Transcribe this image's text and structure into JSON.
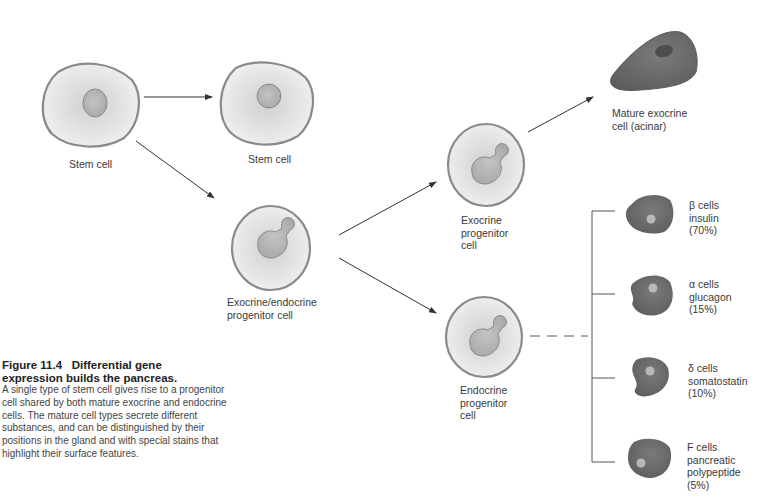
{
  "cells": {
    "stem_cell_1": {
      "label": "Stem cell"
    },
    "stem_cell_2": {
      "label": "Stem cell"
    },
    "exo_endo_progenitor": {
      "label_line1": "Exocrine/endocrine",
      "label_line2": "progenitor cell"
    },
    "exocrine_progenitor": {
      "label_line1": "Exocrine",
      "label_line2": "progenitor",
      "label_line3": "cell"
    },
    "endocrine_progenitor": {
      "label_line1": "Endocrine",
      "label_line2": "progenitor",
      "label_line3": "cell"
    },
    "mature_exocrine": {
      "label_line1": "Mature exocrine",
      "label_line2": "cell (acinar)"
    }
  },
  "endocrine_types": [
    {
      "type": "β cells",
      "product": "insulin",
      "percent": "(70%)"
    },
    {
      "type": "α cells",
      "product": "glucagon",
      "percent": "(15%)"
    },
    {
      "type": "δ cells",
      "product": "somatostatin",
      "percent": "(10%)"
    },
    {
      "type": "F cells",
      "product_line1": "pancreatic",
      "product_line2": "polypeptide",
      "percent": "(5%)"
    }
  ],
  "caption": {
    "figure_number": "Figure 11.4",
    "title_part1": "Differential gene",
    "title_part2": "expression builds the pancreas.",
    "body": "A single type of stem cell gives rise to a progenitor cell shared by both mature exocrine and endocrine cells. The mature cell types secrete different substances, and can be distinguished by their positions in the gland and with special stains that highlight their surface features."
  },
  "colors": {
    "cell_fill": "#e4e4e4",
    "cell_outline": "#8a8a8a",
    "nucleus": "#b8b8b8",
    "mature_cell": "#6e6e6e",
    "mature_nucleus": "#a8a8a8",
    "line": "#444444"
  }
}
